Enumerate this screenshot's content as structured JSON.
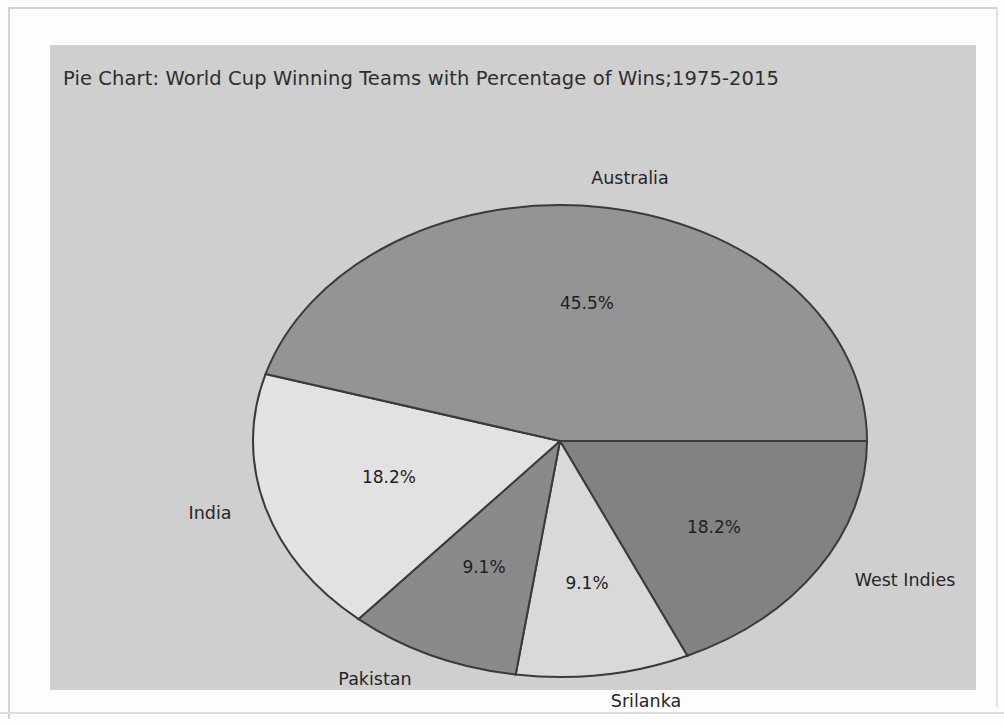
{
  "chart_data": {
    "type": "pie",
    "title": "Pie Chart: World Cup Winning Teams with Percentage of Wins;1975-2015",
    "categories": [
      "West Indies",
      "Srilanka",
      "Pakistan",
      "India",
      "Australia"
    ],
    "values": [
      18.2,
      9.1,
      9.1,
      18.2,
      45.5
    ],
    "value_labels": [
      "18.2%",
      "9.1%",
      "9.1%",
      "18.2%",
      "45.5%"
    ],
    "slice_colors": [
      "#828282",
      "#d9d9d9",
      "#8a8a8a",
      "#e2e2e2",
      "#949494"
    ],
    "edge_color": "#3a3a3a",
    "start_angle": 0,
    "direction": "clockwise",
    "legend": "none",
    "grid": false,
    "background": "#cfcfcf",
    "slices": [
      {
        "name": "West Indies",
        "value": 18.2,
        "value_label": "18.2%",
        "color": "#828282",
        "start_angle": 0,
        "end_angle": 65.5,
        "label_x": 664,
        "label_y": 482,
        "category_x": 855,
        "category_y": 535
      },
      {
        "name": "Srilanka",
        "value": 9.1,
        "value_label": "9.1%",
        "color": "#d9d9d9",
        "start_angle": 65.5,
        "end_angle": 98.3,
        "label_x": 537,
        "label_y": 538,
        "category_x": 596,
        "category_y": 656
      },
      {
        "name": "Pakistan",
        "value": 9.1,
        "value_label": "9.1%",
        "color": "#8a8a8a",
        "start_angle": 98.3,
        "end_angle": 131.0,
        "label_x": 434,
        "label_y": 522,
        "category_x": 325,
        "category_y": 634
      },
      {
        "name": "India",
        "value": 18.2,
        "value_label": "18.2%",
        "color": "#e2e2e2",
        "start_angle": 131.0,
        "end_angle": 196.5,
        "label_x": 339,
        "label_y": 432,
        "category_x": 160,
        "category_y": 468
      },
      {
        "name": "Australia",
        "value": 45.5,
        "value_label": "45.5%",
        "color": "#949494",
        "start_angle": 196.5,
        "end_angle": 360,
        "label_x": 537,
        "label_y": 258,
        "category_x": 580,
        "category_y": 133
      }
    ],
    "geometry": {
      "center_x": 510,
      "center_y": 396,
      "radius_x": 307,
      "radius_y": 236
    }
  }
}
